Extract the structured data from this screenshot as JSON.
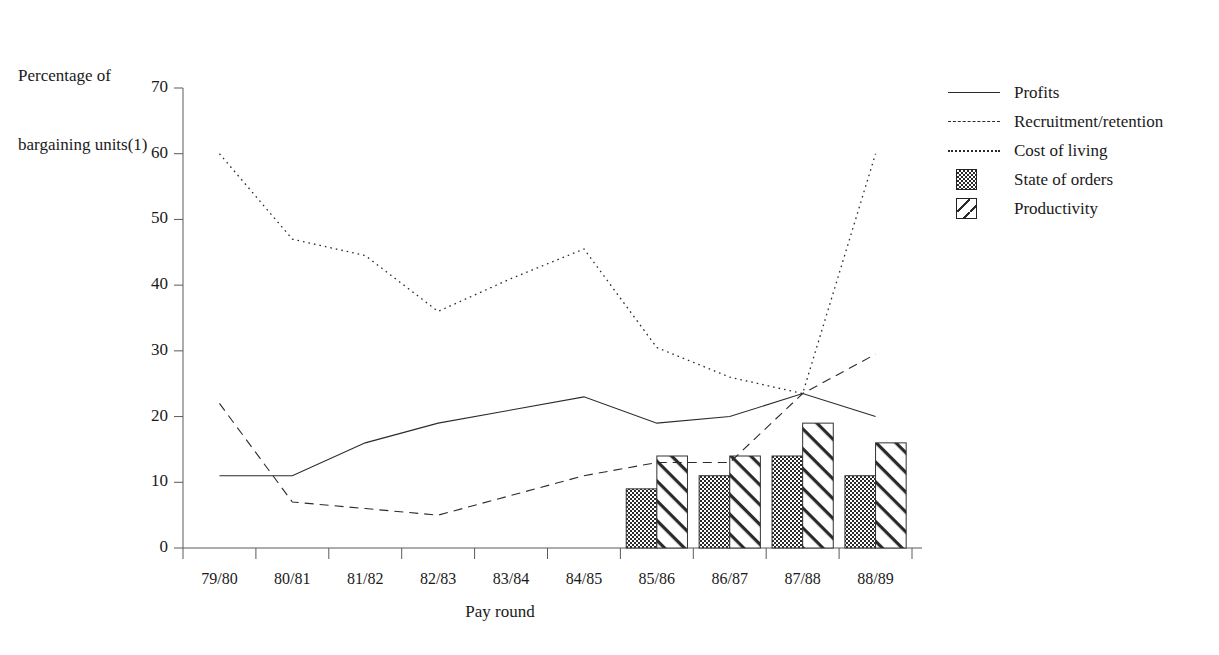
{
  "chart_data": {
    "type": "line",
    "title": "",
    "ylabel": "Percentage of\nbargaining units(1)",
    "ylabel_line1": "Percentage of",
    "ylabel_line2": "bargaining units(1)",
    "xlabel": "Pay round",
    "categories": [
      "79/80",
      "80/81",
      "81/82",
      "82/83",
      "83/84",
      "84/85",
      "85/86",
      "86/87",
      "87/88",
      "88/89"
    ],
    "ylim": [
      0,
      70
    ],
    "yticks": [
      0,
      10,
      20,
      30,
      40,
      50,
      60,
      70
    ],
    "grid": false,
    "legend_position": "right",
    "series": [
      {
        "name": "Profits",
        "style": "solid-line",
        "values": [
          11,
          11,
          16,
          19,
          21,
          23,
          19,
          20,
          23.5,
          20
        ]
      },
      {
        "name": "Recruitment/retention",
        "style": "dashed-line",
        "values": [
          22,
          7,
          6,
          5,
          8,
          11,
          13,
          13,
          23.5,
          29.5
        ]
      },
      {
        "name": "Cost of living",
        "style": "dotted-line",
        "values": [
          60,
          47,
          44.5,
          36,
          41,
          45.5,
          30.5,
          26,
          23.5,
          60
        ]
      },
      {
        "name": "State of orders",
        "style": "bar-checker",
        "values": [
          null,
          null,
          null,
          null,
          null,
          null,
          9,
          11,
          14,
          11
        ]
      },
      {
        "name": "Productivity",
        "style": "bar-hatch",
        "values": [
          null,
          null,
          null,
          null,
          null,
          null,
          14,
          14,
          19,
          16
        ]
      }
    ]
  },
  "legend": {
    "items": [
      {
        "label": "Profits",
        "key": "solid-line-key"
      },
      {
        "label": "Recruitment/retention",
        "key": "dashed-line-key"
      },
      {
        "label": "Cost of living",
        "key": "dotted-line-key"
      },
      {
        "label": "State of orders",
        "key": "checker-swatch"
      },
      {
        "label": "Productivity",
        "key": "hatch-swatch"
      }
    ]
  },
  "colors": {
    "ink": "#1a1a1a",
    "line": "#2b2b2b",
    "background": "#ffffff"
  }
}
